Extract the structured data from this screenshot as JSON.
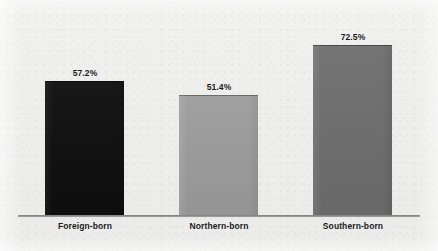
{
  "chart_data": {
    "type": "bar",
    "title": "",
    "subtitle": "",
    "xlabel": "",
    "ylabel": "",
    "categories": [
      "Foreign-born",
      "Northern-born",
      "Southern-born"
    ],
    "values": [
      57.2,
      51.4,
      72.5
    ],
    "value_labels": [
      "57.2%",
      "51.4%",
      "72.5%"
    ],
    "unit": "%",
    "ylim": [
      0,
      80
    ],
    "grid": false,
    "legend": false,
    "legend_position": "none",
    "axis_line": true,
    "bar_colors": [
      "#121212",
      "#9a9a9a",
      "#6e6e6e"
    ],
    "series": [
      {
        "name": "",
        "points": [
          {
            "category": "Foreign-born",
            "value": 57.2,
            "label": "57.2%",
            "color": "#121212"
          },
          {
            "category": "Northern-born",
            "value": 51.4,
            "label": "51.4%",
            "color": "#9a9a9a"
          },
          {
            "category": "Southern-born",
            "value": 72.5,
            "label": "72.5%",
            "color": "#6e6e6e"
          }
        ]
      }
    ]
  },
  "figure": {
    "background_color": "#eeeeed",
    "axis_color": "#7d7d7d",
    "text_color": "#17181a"
  }
}
